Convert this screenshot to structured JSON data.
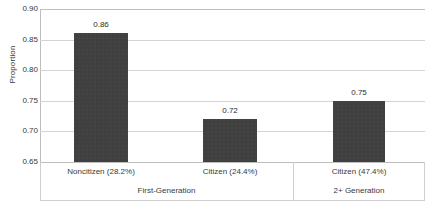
{
  "chart_data": {
    "type": "bar",
    "title": "",
    "xlabel": "",
    "ylabel": "Proportion",
    "ylim": [
      0.65,
      0.9
    ],
    "ytick_step": 0.05,
    "yticks": [
      "0.90",
      "0.85",
      "0.80",
      "0.75",
      "0.70",
      "0.65"
    ],
    "ytick_values": [
      0.9,
      0.85,
      0.8,
      0.75,
      0.7,
      0.65
    ],
    "grid": true,
    "legend": "none",
    "categories": [
      "Noncitizen (28.2%)",
      "Citizen (24.4%)",
      "Citizen (47.4%)"
    ],
    "values": [
      0.86,
      0.72,
      0.75
    ],
    "data_labels": [
      "0.86",
      "0.72",
      "0.75"
    ],
    "groups": [
      {
        "label": "First-Generation",
        "categories": [
          "Noncitizen (28.2%)",
          "Citizen (24.4%)"
        ]
      },
      {
        "label": "2+ Generation",
        "categories": [
          "Citizen (47.4%)"
        ]
      }
    ],
    "bar_color": "#404040",
    "gridline_color": "#d4d4d4",
    "axis_color": "#bdbdbd",
    "background_color": "#ffffff"
  }
}
